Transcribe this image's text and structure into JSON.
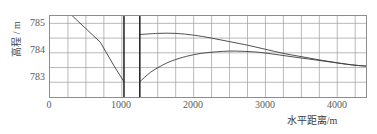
{
  "chart_data": {
    "type": "line",
    "title": "",
    "xlabel": "水平距离/m",
    "ylabel": "高程 / m",
    "xlim": [
      0,
      4400
    ],
    "ylim": [
      782.5,
      785.25
    ],
    "xticks": [
      0,
      1000,
      2000,
      3000,
      4000
    ],
    "xtick_labels": [
      "0",
      "1000",
      "2000",
      "3000",
      "4000"
    ],
    "yticks": [
      783,
      784,
      785
    ],
    "ytick_labels": [
      "783",
      "784",
      "785"
    ],
    "grid": true,
    "grid_x_step": 250,
    "grid_y_step": 0.5,
    "legend": "none",
    "series": [
      {
        "name": "upstream-bed-slope",
        "style": "thin-line",
        "points": [
          [
            300,
            785.28
          ],
          [
            500,
            784.82
          ],
          [
            700,
            784.36
          ],
          [
            900,
            783.52
          ],
          [
            1030,
            783.02
          ]
        ]
      },
      {
        "name": "downstream-water-surface-upper",
        "style": "thin-curve",
        "points": [
          [
            1250,
            784.62
          ],
          [
            1500,
            784.66
          ],
          [
            1750,
            784.66
          ],
          [
            2000,
            784.6
          ],
          [
            2250,
            784.5
          ],
          [
            2500,
            784.38
          ],
          [
            2750,
            784.26
          ],
          [
            3000,
            784.12
          ],
          [
            3250,
            783.98
          ],
          [
            3500,
            783.87
          ],
          [
            3750,
            783.76
          ],
          [
            4000,
            783.66
          ],
          [
            4250,
            783.58
          ],
          [
            4400,
            783.55
          ]
        ]
      },
      {
        "name": "downstream-water-surface-lower",
        "style": "thin-curve",
        "points": [
          [
            1250,
            783.02
          ],
          [
            1400,
            783.34
          ],
          [
            1550,
            783.56
          ],
          [
            1700,
            783.73
          ],
          [
            1900,
            783.88
          ],
          [
            2100,
            783.98
          ],
          [
            2300,
            784.03
          ],
          [
            2500,
            784.06
          ],
          [
            2700,
            784.05
          ],
          [
            2900,
            784.02
          ],
          [
            3100,
            783.96
          ],
          [
            3300,
            783.89
          ],
          [
            3600,
            783.79
          ],
          [
            3900,
            783.69
          ],
          [
            4200,
            783.59
          ],
          [
            4400,
            783.55
          ]
        ]
      }
    ],
    "vertical_markers": [
      {
        "name": "gate-structure-upstream-face",
        "x": 1030,
        "style": "bold"
      },
      {
        "name": "gate-structure-downstream-face",
        "x": 1250,
        "style": "bold"
      }
    ]
  }
}
